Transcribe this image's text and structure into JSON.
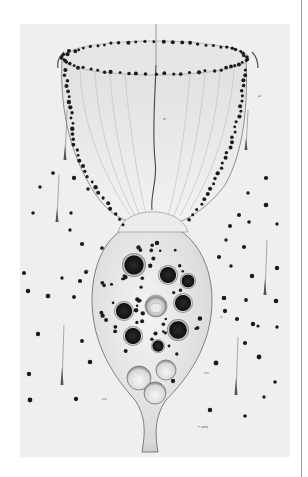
{
  "plate": {
    "bounds": {
      "x": 20,
      "y": 24,
      "w": 270,
      "h": 433
    },
    "paper_color": "#efefef",
    "ink_color": "#1e1e1e",
    "subject": "stalked ciliate protozoan (vorticellid) engraving"
  },
  "labels": [
    {
      "text": "a.",
      "x": 258,
      "y": 97
    },
    {
      "text": "n.",
      "x": 163,
      "y": 120
    },
    {
      "text": "b.",
      "x": 86,
      "y": 272
    },
    {
      "text": "c.",
      "x": 220,
      "y": 318
    },
    {
      "text": "cv.",
      "x": 204,
      "y": 374
    },
    {
      "text": "cv.",
      "x": 102,
      "y": 400
    },
    {
      "text": "• mm",
      "x": 198,
      "y": 428
    }
  ],
  "vacuoles_dark": [
    {
      "cx": 134,
      "cy": 265,
      "r": 12
    },
    {
      "cx": 168,
      "cy": 275,
      "r": 10
    },
    {
      "cx": 188,
      "cy": 281,
      "r": 8
    },
    {
      "cx": 124,
      "cy": 311,
      "r": 10
    },
    {
      "cx": 183,
      "cy": 303,
      "r": 10
    },
    {
      "cx": 178,
      "cy": 330,
      "r": 11
    },
    {
      "cx": 133,
      "cy": 336,
      "r": 10
    },
    {
      "cx": 158,
      "cy": 346,
      "r": 7
    }
  ],
  "nucleus": {
    "cx": 156,
    "cy": 306,
    "r": 11
  },
  "vacuoles_clear": [
    {
      "cx": 139,
      "cy": 378,
      "r": 12
    },
    {
      "cx": 166,
      "cy": 370,
      "r": 10
    },
    {
      "cx": 155,
      "cy": 393,
      "r": 11
    }
  ],
  "needles": [
    {
      "x": 57,
      "y1": 175,
      "y2": 222
    },
    {
      "x": 62,
      "y1": 325,
      "y2": 385
    },
    {
      "x": 265,
      "y1": 240,
      "y2": 295
    },
    {
      "x": 236,
      "y1": 337,
      "y2": 395
    },
    {
      "x": 65,
      "y1": 110,
      "y2": 160
    },
    {
      "x": 246,
      "y1": 110,
      "y2": 150
    }
  ],
  "free_dots": [
    [
      53,
      173
    ],
    [
      40,
      187
    ],
    [
      74,
      178
    ],
    [
      33,
      213
    ],
    [
      71,
      213
    ],
    [
      88,
      189
    ],
    [
      70,
      230
    ],
    [
      82,
      244
    ],
    [
      102,
      248
    ],
    [
      24,
      273
    ],
    [
      62,
      278
    ],
    [
      80,
      281
    ],
    [
      28,
      291
    ],
    [
      48,
      296
    ],
    [
      74,
      297
    ],
    [
      86,
      272
    ],
    [
      266,
      178
    ],
    [
      248,
      193
    ],
    [
      266,
      205
    ],
    [
      239,
      215
    ],
    [
      249,
      222
    ],
    [
      230,
      226
    ],
    [
      277,
      224
    ],
    [
      226,
      240
    ],
    [
      244,
      247
    ],
    [
      219,
      257
    ],
    [
      231,
      266
    ],
    [
      252,
      276
    ],
    [
      277,
      268
    ],
    [
      224,
      298
    ],
    [
      246,
      300
    ],
    [
      225,
      311
    ],
    [
      237,
      319
    ],
    [
      253,
      324
    ],
    [
      276,
      301
    ],
    [
      38,
      334
    ],
    [
      82,
      341
    ],
    [
      90,
      362
    ],
    [
      29,
      374
    ],
    [
      76,
      399
    ],
    [
      30,
      400
    ],
    [
      258,
      326
    ],
    [
      277,
      327
    ],
    [
      245,
      343
    ],
    [
      259,
      357
    ],
    [
      216,
      363
    ],
    [
      275,
      382
    ],
    [
      264,
      397
    ],
    [
      210,
      410
    ],
    [
      245,
      416
    ],
    [
      173,
      381
    ]
  ],
  "rim_dots_count": 64
}
